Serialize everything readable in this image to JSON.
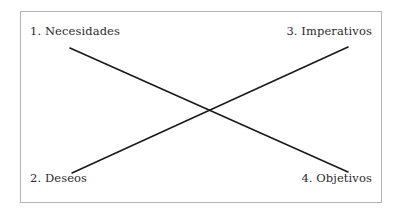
{
  "figure": {
    "background_color": "#ffffff",
    "frame": {
      "border_color": "#b4b4b4",
      "fill_color": "#ffffff"
    },
    "text_color": "#2b2b2b",
    "line_color": "#1a1a1a"
  },
  "labels": {
    "top_left": "1. Necesidades",
    "top_right": "3. Imperativos",
    "bottom_left": "2. Deseos",
    "bottom_right": "4. Objetivos"
  },
  "connectors": [
    {
      "name": "necesidades-to-objetivos",
      "from": "1. Necesidades",
      "to": "4. Objetivos",
      "x1": 70,
      "y1": 48,
      "x2": 348,
      "y2": 172
    },
    {
      "name": "deseos-to-imperativos",
      "from": "2. Deseos",
      "to": "3. Imperativos",
      "x1": 72,
      "y1": 173,
      "x2": 348,
      "y2": 47
    }
  ],
  "intersection": {
    "x": 205,
    "y": 110
  }
}
